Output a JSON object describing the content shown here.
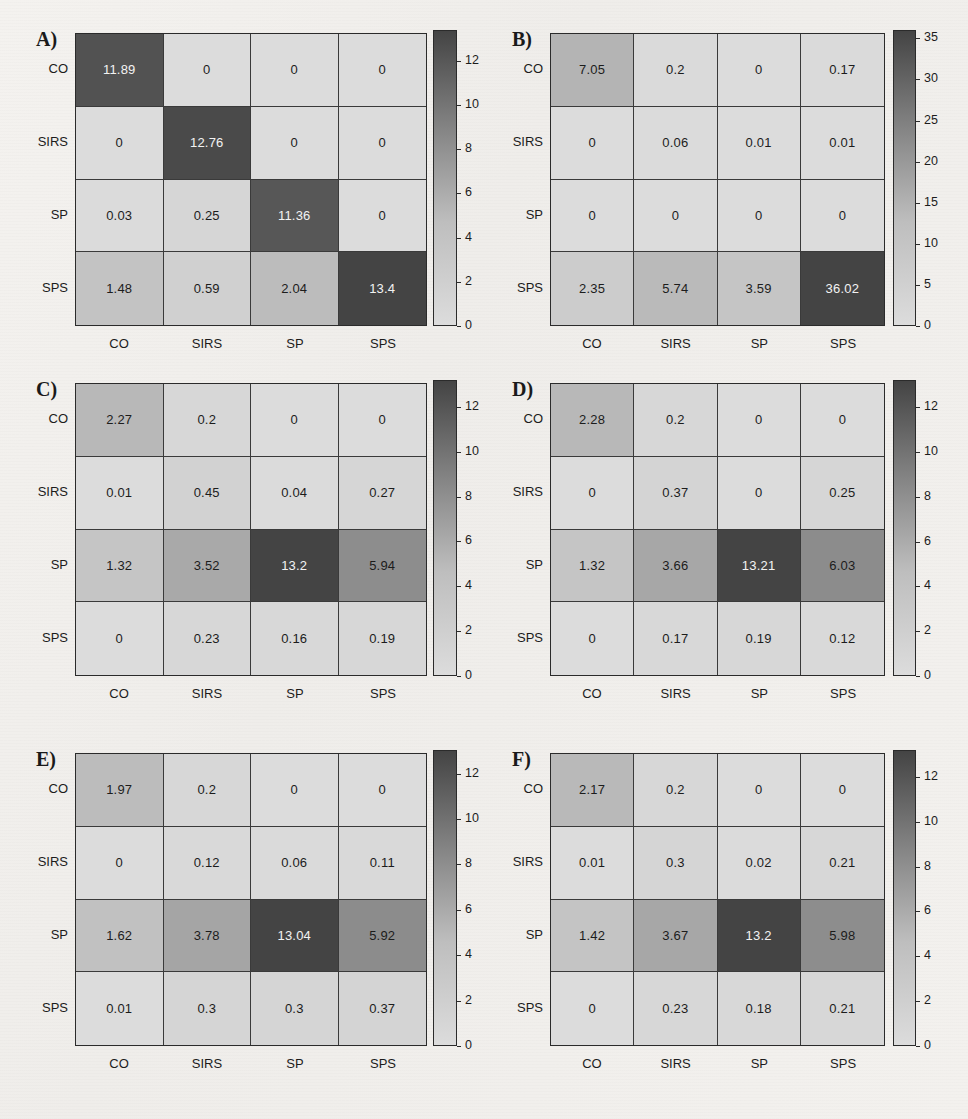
{
  "figure": {
    "type": "confusion-matrix-grid",
    "panel_count": 6,
    "class_labels": [
      "CO",
      "SIRS",
      "SP",
      "SPS"
    ]
  },
  "chart_data": [
    {
      "type": "heatmap",
      "panel": "A)",
      "title": "",
      "xlabel": "",
      "ylabel": "",
      "x_tick_labels": [
        "CO",
        "SIRS",
        "SP",
        "SPS"
      ],
      "y_tick_labels": [
        "CO",
        "SIRS",
        "SP",
        "SPS"
      ],
      "colorbar_ticks": [
        0,
        2,
        4,
        6,
        8,
        10,
        12
      ],
      "colorbar_range": [
        0,
        13.4
      ],
      "grid": true,
      "legend": "colorbar-right",
      "values": [
        [
          11.89,
          0,
          0,
          0
        ],
        [
          0,
          12.76,
          0,
          0
        ],
        [
          0.03,
          0.25,
          11.36,
          0
        ],
        [
          1.48,
          0.59,
          2.04,
          13.4
        ]
      ],
      "labels": [
        [
          "11.89",
          "0",
          "0",
          "0"
        ],
        [
          "0",
          "12.76",
          "0",
          "0"
        ],
        [
          "0.03",
          "0.25",
          "11.36",
          "0"
        ],
        [
          "1.48",
          "0.59",
          "2.04",
          "13.4"
        ]
      ]
    },
    {
      "type": "heatmap",
      "panel": "B)",
      "title": "",
      "xlabel": "",
      "ylabel": "",
      "x_tick_labels": [
        "CO",
        "SIRS",
        "SP",
        "SPS"
      ],
      "y_tick_labels": [
        "CO",
        "SIRS",
        "SP",
        "SPS"
      ],
      "colorbar_ticks": [
        0,
        5,
        10,
        15,
        20,
        25,
        30,
        35
      ],
      "colorbar_range": [
        0,
        36.02
      ],
      "grid": true,
      "legend": "colorbar-right",
      "values": [
        [
          7.05,
          0.2,
          0,
          0.17
        ],
        [
          0,
          0.06,
          0.01,
          0.01
        ],
        [
          0,
          0,
          0,
          0
        ],
        [
          2.35,
          5.74,
          3.59,
          36.02
        ]
      ],
      "labels": [
        [
          "7.05",
          "0.2",
          "0",
          "0.17"
        ],
        [
          "0",
          "0.06",
          "0.01",
          "0.01"
        ],
        [
          "0",
          "0",
          "0",
          "0"
        ],
        [
          "2.35",
          "5.74",
          "3.59",
          "36.02"
        ]
      ]
    },
    {
      "type": "heatmap",
      "panel": "C)",
      "title": "",
      "xlabel": "",
      "ylabel": "",
      "x_tick_labels": [
        "CO",
        "SIRS",
        "SP",
        "SPS"
      ],
      "y_tick_labels": [
        "CO",
        "SIRS",
        "SP",
        "SPS"
      ],
      "colorbar_ticks": [
        0,
        2,
        4,
        6,
        8,
        10,
        12
      ],
      "colorbar_range": [
        0,
        13.2
      ],
      "grid": true,
      "legend": "colorbar-right",
      "values": [
        [
          2.27,
          0.2,
          0,
          0
        ],
        [
          0.01,
          0.45,
          0.04,
          0.27
        ],
        [
          1.32,
          3.52,
          13.2,
          5.94
        ],
        [
          0,
          0.23,
          0.16,
          0.19
        ]
      ],
      "labels": [
        [
          "2.27",
          "0.2",
          "0",
          "0"
        ],
        [
          "0.01",
          "0.45",
          "0.04",
          "0.27"
        ],
        [
          "1.32",
          "3.52",
          "13.2",
          "5.94"
        ],
        [
          "0",
          "0.23",
          "0.16",
          "0.19"
        ]
      ]
    },
    {
      "type": "heatmap",
      "panel": "D)",
      "title": "",
      "xlabel": "",
      "ylabel": "",
      "x_tick_labels": [
        "CO",
        "SIRS",
        "SP",
        "SPS"
      ],
      "y_tick_labels": [
        "CO",
        "SIRS",
        "SP",
        "SPS"
      ],
      "colorbar_ticks": [
        0,
        2,
        4,
        6,
        8,
        10,
        12
      ],
      "colorbar_range": [
        0,
        13.21
      ],
      "grid": true,
      "legend": "colorbar-right",
      "values": [
        [
          2.28,
          0.2,
          0,
          0
        ],
        [
          0,
          0.37,
          0,
          0.25
        ],
        [
          1.32,
          3.66,
          13.21,
          6.03
        ],
        [
          0,
          0.17,
          0.19,
          0.12
        ]
      ],
      "labels": [
        [
          "2.28",
          "0.2",
          "0",
          "0"
        ],
        [
          "0",
          "0.37",
          "0",
          "0.25"
        ],
        [
          "1.32",
          "3.66",
          "13.21",
          "6.03"
        ],
        [
          "0",
          "0.17",
          "0.19",
          "0.12"
        ]
      ]
    },
    {
      "type": "heatmap",
      "panel": "E)",
      "title": "",
      "xlabel": "",
      "ylabel": "",
      "x_tick_labels": [
        "CO",
        "SIRS",
        "SP",
        "SPS"
      ],
      "y_tick_labels": [
        "CO",
        "SIRS",
        "SP",
        "SPS"
      ],
      "colorbar_ticks": [
        0,
        2,
        4,
        6,
        8,
        10,
        12
      ],
      "colorbar_range": [
        0,
        13.04
      ],
      "grid": true,
      "legend": "colorbar-right",
      "values": [
        [
          1.97,
          0.2,
          0,
          0
        ],
        [
          0,
          0.12,
          0.06,
          0.11
        ],
        [
          1.62,
          3.78,
          13.04,
          5.92
        ],
        [
          0.01,
          0.3,
          0.3,
          0.37
        ]
      ],
      "labels": [
        [
          "1.97",
          "0.2",
          "0",
          "0"
        ],
        [
          "0",
          "0.12",
          "0.06",
          "0.11"
        ],
        [
          "1.62",
          "3.78",
          "13.04",
          "5.92"
        ],
        [
          "0.01",
          "0.3",
          "0.3",
          "0.37"
        ]
      ]
    },
    {
      "type": "heatmap",
      "panel": "F)",
      "title": "",
      "xlabel": "",
      "ylabel": "",
      "x_tick_labels": [
        "CO",
        "SIRS",
        "SP",
        "SPS"
      ],
      "y_tick_labels": [
        "CO",
        "SIRS",
        "SP",
        "SPS"
      ],
      "colorbar_ticks": [
        0,
        2,
        4,
        6,
        8,
        10,
        12
      ],
      "colorbar_range": [
        0,
        13.2
      ],
      "grid": true,
      "legend": "colorbar-right",
      "values": [
        [
          2.17,
          0.2,
          0,
          0
        ],
        [
          0.01,
          0.3,
          0.02,
          0.21
        ],
        [
          1.42,
          3.67,
          13.2,
          5.98
        ],
        [
          0,
          0.23,
          0.18,
          0.21
        ]
      ],
      "labels": [
        [
          "2.17",
          "0.2",
          "0",
          "0"
        ],
        [
          "0.01",
          "0.3",
          "0.02",
          "0.21"
        ],
        [
          "1.42",
          "3.67",
          "13.2",
          "5.98"
        ],
        [
          "0",
          "0.23",
          "0.18",
          "0.21"
        ]
      ]
    }
  ],
  "colors": {
    "cmap_low": "#dcdcdc",
    "cmap_high": "#4a4a4a",
    "text_dark": "#1c1c1c",
    "text_light": "#f2f2f2",
    "grid_line": "#3a3a3a",
    "page_background": "#f2f0ed"
  }
}
